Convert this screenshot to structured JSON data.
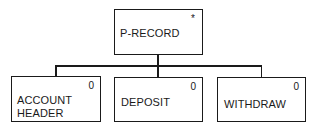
{
  "diagram": {
    "type": "hierarchy-tree",
    "root": {
      "label": "P-RECORD",
      "marker": "*"
    },
    "children": [
      {
        "label_lines": [
          "ACCOUNT",
          "HEADER"
        ],
        "marker": "0"
      },
      {
        "label_lines": [
          "DEPOSIT"
        ],
        "marker": "0"
      },
      {
        "label_lines": [
          "WITHDRAW"
        ],
        "marker": "0"
      }
    ]
  }
}
